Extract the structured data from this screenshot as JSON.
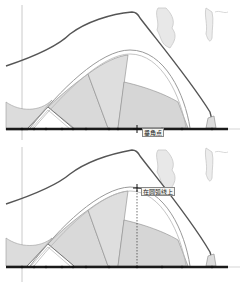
{
  "viewport": {
    "background": "#ffffff",
    "panels": [
      {
        "id": "top",
        "cursor": {
          "x": 137,
          "y": 129,
          "icon": "crosshair-move-icon"
        },
        "inference_tooltip": {
          "text": "垂角点",
          "x": 142,
          "y": 128
        },
        "guide_line": false
      },
      {
        "id": "bottom",
        "cursor": {
          "x": 137,
          "y": 46,
          "icon": "crosshair-move-icon"
        },
        "inference_tooltip": {
          "text": "在圆弧线上",
          "x": 141,
          "y": 45
        },
        "guide_line": true
      }
    ]
  },
  "colors": {
    "ground_line": "#1a1a1a",
    "roof_outline": "#555555",
    "shell_fill": "#d9d9d9",
    "shell_stroke": "#8a8a8a",
    "arc_stroke": "#9a9a9a",
    "axis_line": "#bdbdbd",
    "trees": "#c8c8c8"
  }
}
